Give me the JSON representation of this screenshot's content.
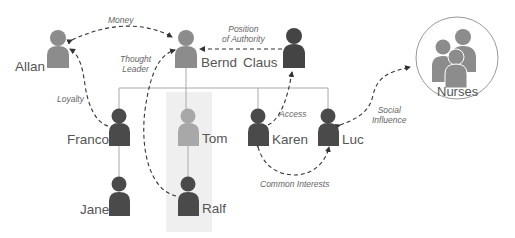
{
  "diagram": {
    "colors": {
      "person_dark": "#4a4a4a",
      "person_medium": "#8c8c8c",
      "person_light": "#a8a8a8",
      "line": "#aaaaaa",
      "dashed": "#333333",
      "highlight_column": "#efefef",
      "group_circle_stroke": "#999999"
    },
    "people": [
      {
        "id": "allan",
        "name": "Allan",
        "shade": "medium"
      },
      {
        "id": "bernd",
        "name": "Bernd",
        "shade": "medium"
      },
      {
        "id": "claus",
        "name": "Claus",
        "shade": "dark"
      },
      {
        "id": "franco",
        "name": "Franco",
        "shade": "dark"
      },
      {
        "id": "tom",
        "name": "Tom",
        "shade": "light"
      },
      {
        "id": "karen",
        "name": "Karen",
        "shade": "dark"
      },
      {
        "id": "luc",
        "name": "Luc",
        "shade": "dark"
      },
      {
        "id": "jane",
        "name": "Jane",
        "shade": "dark"
      },
      {
        "id": "ralf",
        "name": "Ralf",
        "shade": "dark"
      }
    ],
    "group": {
      "id": "nurses",
      "name": "Nurses"
    },
    "org_lines": [
      {
        "from": "Bernd",
        "to": [
          "Franco",
          "Tom",
          "Karen",
          "Luc"
        ]
      },
      {
        "from": "Franco",
        "to": [
          "Jane"
        ]
      },
      {
        "from": "Tom",
        "to": [
          "Ralf"
        ]
      }
    ],
    "influence_edges": [
      {
        "from": "Allan",
        "to": "Bernd",
        "label": "Money",
        "bidirectional": true
      },
      {
        "from": "Claus",
        "to": "Bernd",
        "label_line1": "Position",
        "label_line2": "of Authority"
      },
      {
        "from": "Ralf",
        "to": "Bernd",
        "label_line1": "Thought",
        "label_line2": "Leader"
      },
      {
        "from": "Franco",
        "to": "Allan",
        "label": "Loyalty"
      },
      {
        "from": "Karen",
        "to": "Claus",
        "label": "Access"
      },
      {
        "from": "Luc",
        "to": "Nurses",
        "label_line1": "Social",
        "label_line2": "Influence",
        "bidirectional": true
      },
      {
        "from": "Karen",
        "to": "Luc",
        "label": "Common Interests",
        "bidirectional": true
      }
    ]
  }
}
